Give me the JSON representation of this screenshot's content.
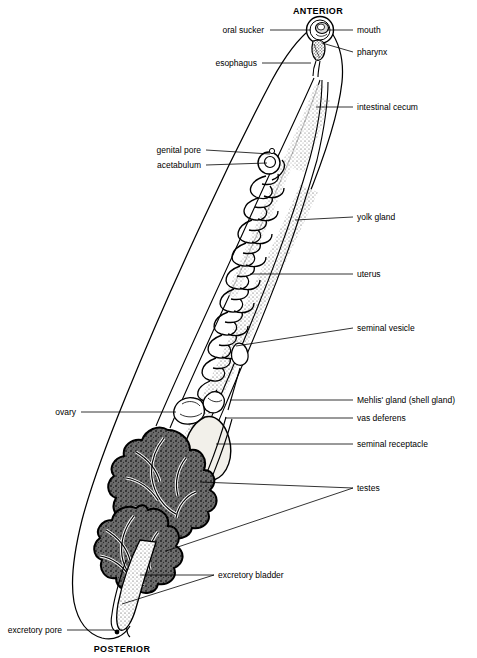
{
  "figure": {
    "orientation_labels": [
      {
        "name": "anterior",
        "text": "ANTERIOR",
        "x": 318,
        "y": 6
      },
      {
        "name": "posterior",
        "text": "POSTERIOR",
        "x": 122,
        "y": 644
      }
    ]
  },
  "labels": [
    {
      "name": "oral-sucker",
      "text": "oral sucker",
      "side": "left",
      "tx": 264,
      "ty": 26,
      "lx": 270,
      "ly": 30,
      "px": 311,
      "py": 30
    },
    {
      "name": "mouth",
      "text": "mouth",
      "side": "right",
      "tx": 357,
      "ty": 26,
      "lx": 353,
      "ly": 30,
      "px": 327,
      "py": 30
    },
    {
      "name": "pharynx",
      "text": "pharynx",
      "side": "right",
      "tx": 357,
      "ty": 48,
      "lx": 353,
      "ly": 52,
      "px": 322,
      "py": 43
    },
    {
      "name": "esophagus",
      "text": "esophagus",
      "side": "left",
      "tx": 257,
      "ty": 59,
      "lx": 262,
      "ly": 63,
      "px": 311,
      "py": 63
    },
    {
      "name": "intestinal-cecum",
      "text": "intestinal cecum",
      "side": "right",
      "tx": 357,
      "ty": 103,
      "lx": 353,
      "ly": 107,
      "px": 316,
      "py": 107
    },
    {
      "name": "genital-pore",
      "text": "genital pore",
      "side": "left",
      "tx": 201,
      "ty": 146,
      "lx": 206,
      "ly": 150,
      "px": 270,
      "py": 154
    },
    {
      "name": "acetabulum",
      "text": "acetabulum",
      "side": "left",
      "tx": 201,
      "ty": 161,
      "lx": 206,
      "ly": 165,
      "px": 267,
      "py": 163
    },
    {
      "name": "yolk-gland",
      "text": "yolk gland",
      "side": "right",
      "tx": 357,
      "ty": 213,
      "lx": 353,
      "ly": 217,
      "px": 295,
      "py": 220
    },
    {
      "name": "uterus",
      "text": "uterus",
      "side": "right",
      "tx": 357,
      "ty": 270,
      "lx": 353,
      "ly": 274,
      "px": 250,
      "py": 274
    },
    {
      "name": "seminal-vesicle",
      "text": "seminal vesicle",
      "side": "right",
      "tx": 357,
      "ty": 324,
      "lx": 353,
      "ly": 328,
      "px": 236,
      "py": 346
    },
    {
      "name": "mehlis-gland",
      "text": "Mehlis' gland (shell gland)",
      "side": "right",
      "tx": 357,
      "ty": 396,
      "lx": 353,
      "ly": 400,
      "px": 230,
      "py": 400
    },
    {
      "name": "vas-deferens",
      "text": "vas deferens",
      "side": "right",
      "tx": 357,
      "ty": 414,
      "lx": 353,
      "ly": 418,
      "px": 225,
      "py": 418
    },
    {
      "name": "seminal-receptacle",
      "text": "seminal receptacle",
      "side": "right",
      "tx": 357,
      "ty": 440,
      "lx": 353,
      "ly": 444,
      "px": 216,
      "py": 444
    },
    {
      "name": "ovary",
      "text": "ovary",
      "side": "left",
      "tx": 76,
      "ty": 408,
      "lx": 81,
      "ly": 412,
      "px": 176,
      "py": 412
    },
    {
      "name": "testes",
      "text": "testes",
      "side": "right",
      "tx": 357,
      "ty": 484,
      "lx": 353,
      "ly": 488,
      "px": 200,
      "py": 482
    },
    {
      "name": "excretory-bladder",
      "text": "excretory bladder",
      "side": "right",
      "tx": 218,
      "ty": 571,
      "lx": 214,
      "ly": 575,
      "px": 140,
      "py": 575
    },
    {
      "name": "excretory-pore",
      "text": "excretory pore",
      "side": "left",
      "tx": 62,
      "ty": 626,
      "lx": 67,
      "ly": 630,
      "px": 114,
      "py": 630
    }
  ],
  "leader_extra": [
    {
      "name": "testes-leader-2",
      "from_x": 353,
      "from_y": 488,
      "to_x": 166,
      "to_y": 551
    },
    {
      "name": "excretory-bladder-leader-2",
      "from_x": 214,
      "from_y": 575,
      "to_x": 122,
      "to_y": 604
    }
  ],
  "colors": {
    "ink": "#000000",
    "background": "#ffffff",
    "stipple": "#3a3a3a",
    "testes_fill": "#555555"
  }
}
